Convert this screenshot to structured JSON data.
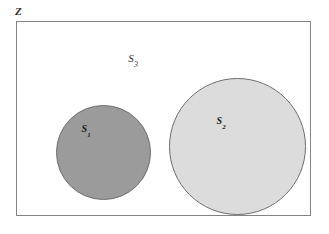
{
  "diagram": {
    "background_color": "#ffffff",
    "universe": {
      "label": "Z",
      "border_color": "#848484",
      "fill_color": "#ffffff"
    },
    "sets": [
      {
        "name": "s1",
        "base": "S",
        "subscript": "1",
        "fill_color": "#9b9b9b",
        "border_color": "#6e6e6e"
      },
      {
        "name": "s2",
        "base": "S",
        "subscript": "2",
        "fill_color": "#dcdcdc",
        "border_color": "#6e6e6e"
      },
      {
        "name": "s3",
        "base": "S",
        "subscript": "3",
        "fill_color": "#ffffff",
        "border_color": "#848484"
      }
    ]
  }
}
